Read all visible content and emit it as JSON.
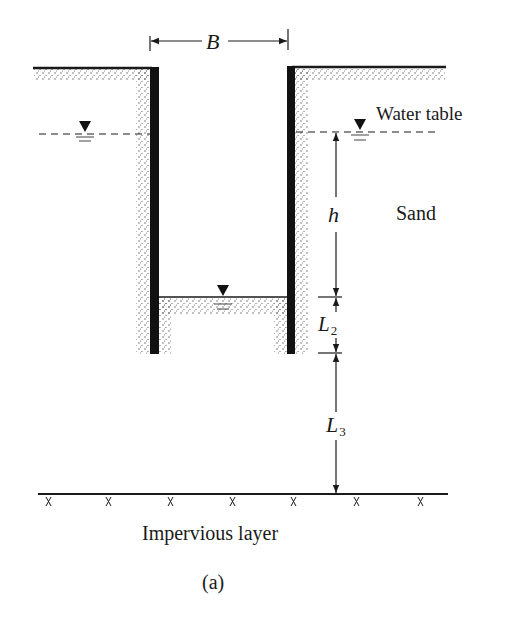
{
  "diagram": {
    "labels": {
      "width": "B",
      "water_table": "Water table",
      "head": "h",
      "soil": "Sand",
      "penetration_main": "L",
      "penetration_sub": "2",
      "depth_main": "L",
      "depth_sub": "3",
      "impervious": "Impervious layer",
      "caption": "(a)"
    },
    "colors": {
      "ink": "#1a1a1a",
      "background": "#ffffff",
      "sand_dots": "#555555"
    }
  }
}
